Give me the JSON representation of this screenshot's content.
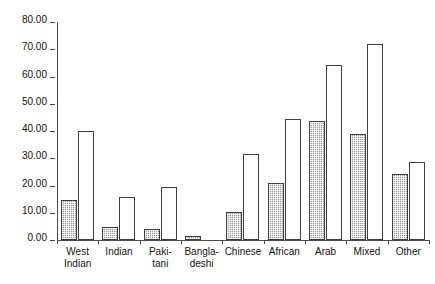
{
  "chart_data": {
    "type": "bar",
    "title": "",
    "subtitle": "",
    "xlabel": "",
    "ylabel": "",
    "ylim": [
      0,
      80
    ],
    "yticks": [
      0,
      10,
      20,
      30,
      40,
      50,
      60,
      70,
      80
    ],
    "ytick_labels": [
      "0.00",
      "10.00",
      "20.00",
      "30.00",
      "40.00",
      "50.00",
      "60.00",
      "70.00",
      "80.00"
    ],
    "grid": false,
    "legend_position": "none",
    "categories": [
      "West\nIndian",
      "Indian",
      "Paki-\ntani",
      "Bangla-\ndeshi",
      "Chinese",
      "African",
      "Arab",
      "Mixed",
      "Other"
    ],
    "series": [
      {
        "name": "series-1",
        "style": "shaded",
        "color": "#9d9d9d",
        "values": [
          14.8,
          4.9,
          4.0,
          1.3,
          10.2,
          20.8,
          43.8,
          39.0,
          24.2
        ]
      },
      {
        "name": "series-2",
        "style": "hollow",
        "color": "#ffffff",
        "values": [
          40.1,
          15.7,
          19.5,
          0.0,
          31.6,
          44.4,
          64.1,
          71.8,
          28.8
        ]
      }
    ],
    "axis_color": "#4a4a4a",
    "bar_outline_color": "#3d3d3d"
  }
}
